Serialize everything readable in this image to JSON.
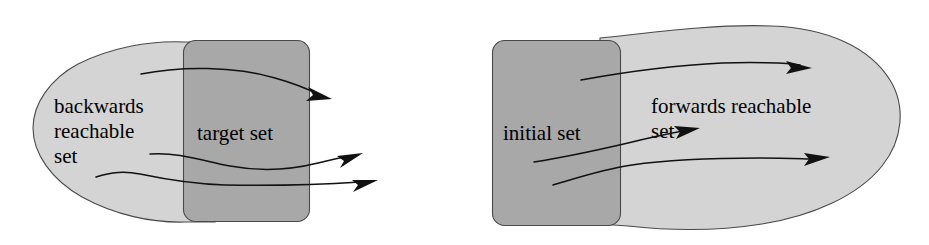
{
  "figure": {
    "background_color": "#ffffff",
    "colors": {
      "reachable_set_fill": "#d4d4d4",
      "target_set_fill": "#a8a8a8",
      "initial_set_fill": "#a8a8a8",
      "outline": "#4a4a4a",
      "trajectory": "#111111"
    }
  },
  "left_panel": {
    "name": "backwards-reachability-diagram",
    "reachable_set": {
      "label_lines": [
        "backwards",
        "reachable",
        "set"
      ],
      "label_line_1": "backwards",
      "label_line_2": "reachable",
      "label_line_3": "set",
      "fill": "#d4d4d4"
    },
    "target_set": {
      "label": "target set",
      "fill": "#a8a8a8"
    },
    "trajectories": [
      {
        "name": "trajectory-1",
        "direction": "rightward"
      },
      {
        "name": "trajectory-2",
        "direction": "rightward"
      },
      {
        "name": "trajectory-3",
        "direction": "rightward"
      }
    ]
  },
  "right_panel": {
    "name": "forwards-reachability-diagram",
    "initial_set": {
      "label": "initial set",
      "fill": "#a8a8a8"
    },
    "reachable_set": {
      "label_lines": [
        "forwards reachable",
        "set"
      ],
      "label_line_1": "forwards reachable",
      "label_line_2": "set",
      "fill": "#d4d4d4"
    },
    "trajectories": [
      {
        "name": "trajectory-1",
        "direction": "rightward"
      },
      {
        "name": "trajectory-2",
        "direction": "rightward"
      },
      {
        "name": "trajectory-3",
        "direction": "rightward"
      }
    ]
  }
}
